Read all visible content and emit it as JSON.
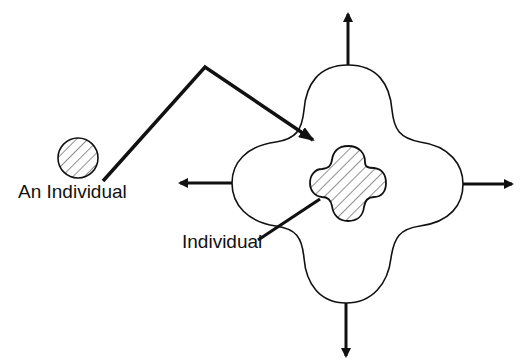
{
  "diagram": {
    "labels": {
      "outer_individual": "An Individual",
      "inner_individual": "Individual"
    },
    "elements": [
      {
        "id": "individual-circle",
        "shape": "circle",
        "fill": "hatched"
      },
      {
        "id": "transition-arrow",
        "shape": "bent-arrow",
        "from": "individual-circle",
        "to": "expanded-region"
      },
      {
        "id": "expanded-region",
        "shape": "four-lobed-blob",
        "fill": "none"
      },
      {
        "id": "inner-individual",
        "shape": "four-lobed-cross",
        "fill": "hatched"
      },
      {
        "id": "expansion-arrows",
        "directions": [
          "up",
          "down",
          "left",
          "right"
        ]
      }
    ],
    "colors": {
      "stroke": "#111111",
      "background": "#ffffff"
    }
  }
}
